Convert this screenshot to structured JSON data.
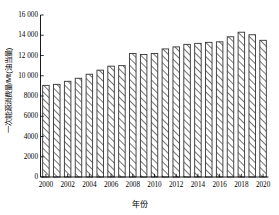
{
  "chart_data": {
    "type": "bar",
    "title": "",
    "xlabel": "年份",
    "ylabel": "一次能源消费量/Mt(油当量)",
    "categories": [
      2000,
      2001,
      2002,
      2003,
      2004,
      2005,
      2006,
      2007,
      2008,
      2009,
      2010,
      2011,
      2012,
      2013,
      2014,
      2015,
      2016,
      2017,
      2018,
      2019,
      2020
    ],
    "values": [
      9050,
      9150,
      9450,
      9750,
      10150,
      10550,
      10950,
      11000,
      12200,
      12100,
      12200,
      12650,
      12850,
      13100,
      13200,
      13300,
      13350,
      13850,
      14300,
      14050,
      13500
    ],
    "xlim": [
      1999.5,
      2020.5
    ],
    "ylim": [
      0,
      16000
    ],
    "yticks": [
      0,
      2000,
      4000,
      6000,
      8000,
      10000,
      12000,
      14000,
      16000
    ],
    "ytick_labels": [
      "0",
      "2000",
      "4000",
      "6000",
      "8000",
      "10 000",
      "12 000",
      "14 000",
      "16 000"
    ],
    "xticks": [
      2000,
      2002,
      2004,
      2006,
      2008,
      2010,
      2012,
      2014,
      2016,
      2018,
      2020
    ],
    "xtick_labels": [
      "2000",
      "2002",
      "2004",
      "2006",
      "2008",
      "2010",
      "2012",
      "2014",
      "2016",
      "2018",
      "2020"
    ],
    "grid": false,
    "legend": "none",
    "bar_fill": "#ffffff",
    "bar_edge": "#333333",
    "hatch": "diagonal-forward",
    "axis_color": "#000000"
  }
}
